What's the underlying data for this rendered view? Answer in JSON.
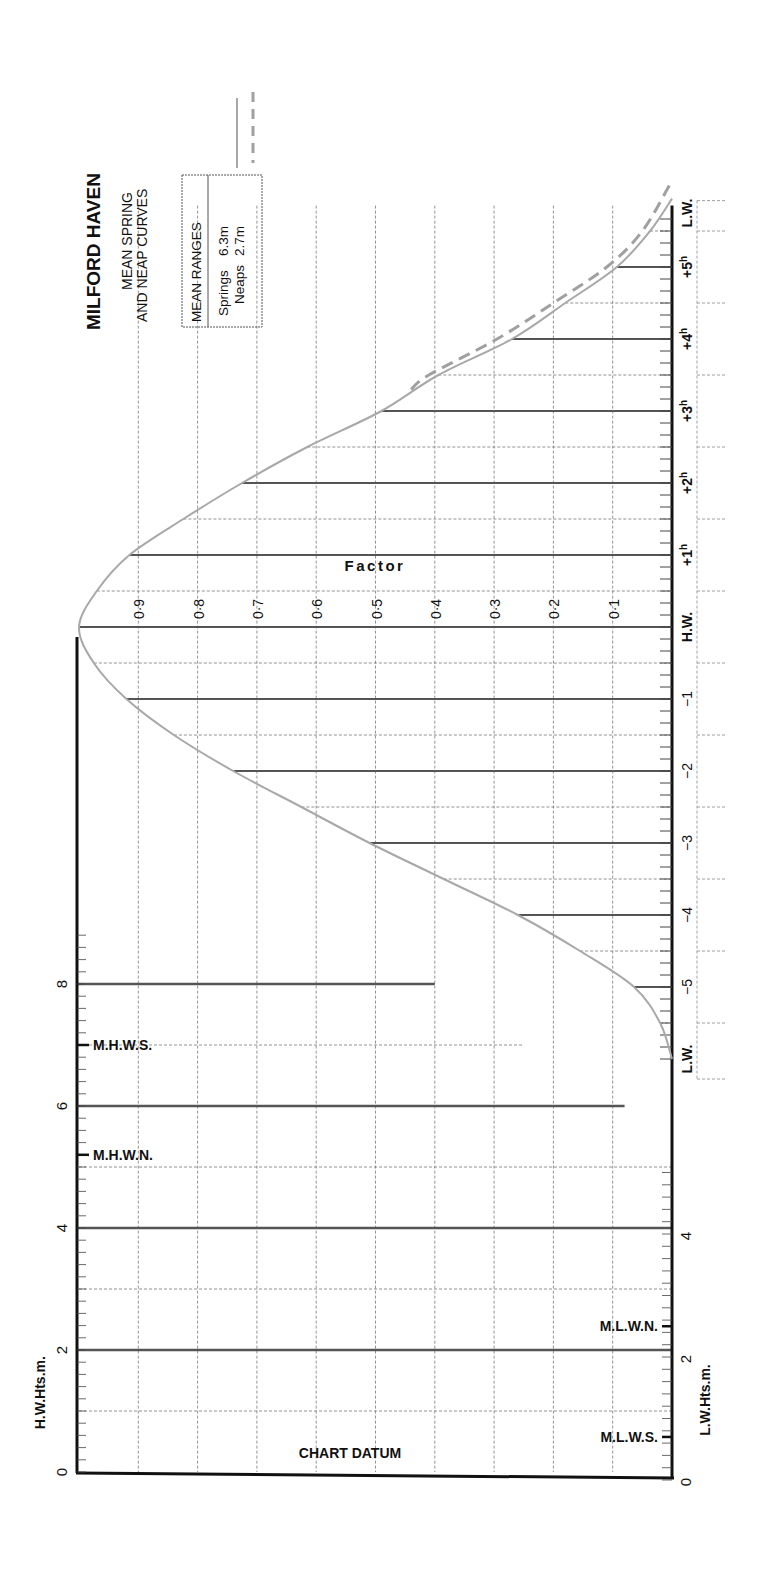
{
  "chart_data": {
    "type": "line",
    "title": "MILFORD HAVEN",
    "subtitle_lines": [
      "MEAN SPRING",
      "AND NEAP CURVES"
    ],
    "orientation": "rotated-90",
    "xlabel": "Time relative to H.W. (hours)",
    "ylabel": "Factor",
    "factor_ticks": [
      "0·1",
      "0·2",
      "0·3",
      "0·4",
      "0·5",
      "0·6",
      "0·7",
      "0·8",
      "0·9"
    ],
    "time_ticks": [
      {
        "t": -6.0,
        "label": "L.W."
      },
      {
        "t": -5,
        "label": "−5"
      },
      {
        "t": -4,
        "label": "−4"
      },
      {
        "t": -3,
        "label": "−3"
      },
      {
        "t": -2,
        "label": "−2"
      },
      {
        "t": -1,
        "label": "−1"
      },
      {
        "t": 0,
        "label": "H.W."
      },
      {
        "t": 1,
        "label": "+1",
        "sup": "h"
      },
      {
        "t": 2,
        "label": "+2",
        "sup": "h"
      },
      {
        "t": 3,
        "label": "+3",
        "sup": "h"
      },
      {
        "t": 4,
        "label": "+4",
        "sup": "h"
      },
      {
        "t": 5,
        "label": "+5",
        "sup": "h"
      }
    ],
    "lw_end_label": "L.W.",
    "ylim": [
      0,
      1
    ],
    "series": [
      {
        "name": "Springs",
        "style": "solid",
        "color": "#a8a8a8",
        "x": [
          -6.0,
          -5.5,
          -5.0,
          -4.5,
          -4.0,
          -3.5,
          -3.0,
          -2.5,
          -2.0,
          -1.5,
          -1.0,
          -0.5,
          0,
          0.5,
          1.0,
          1.5,
          2.0,
          2.5,
          3.0,
          3.5,
          4.0,
          4.5,
          5.0,
          5.5,
          5.95
        ],
        "y": [
          0.0,
          0.02,
          0.064,
          0.155,
          0.26,
          0.385,
          0.51,
          0.625,
          0.74,
          0.84,
          0.92,
          0.975,
          1.0,
          0.97,
          0.915,
          0.824,
          0.725,
          0.615,
          0.49,
          0.394,
          0.27,
          0.18,
          0.093,
          0.037,
          0.0
        ]
      },
      {
        "name": "Neaps",
        "style": "dashed",
        "color": "#a0a0a0",
        "x": [
          3.3,
          3.5,
          4.0,
          4.5,
          5.0,
          5.5,
          6.2
        ],
        "y": [
          0.44,
          0.41,
          0.295,
          0.2,
          0.11,
          0.05,
          0.0
        ]
      }
    ],
    "heights": {
      "hw_axis_label": "H.W.Hts.m.",
      "lw_axis_label": "L.W.Hts.m.",
      "datum_label": "CHART DATUM",
      "hw_tick_labels": [
        {
          "v": 0,
          "label": "0"
        },
        {
          "v": 2,
          "label": "2"
        },
        {
          "v": 4,
          "label": "4"
        },
        {
          "v": 6,
          "label": "6"
        },
        {
          "v": 8,
          "label": "8"
        }
      ],
      "lw_tick_labels": [
        {
          "v": 0,
          "label": "0"
        },
        {
          "v": 2,
          "label": "2"
        },
        {
          "v": 4,
          "label": "4"
        }
      ],
      "hw_markers": [
        {
          "name": "M.H.W.S.",
          "value": 7.0
        },
        {
          "name": "M.H.W.N.",
          "value": 5.2
        }
      ],
      "lw_markers": [
        {
          "name": "M.L.W.N.",
          "value": 2.5
        },
        {
          "name": "M.L.W.S.",
          "value": 0.7
        }
      ],
      "height_lines": [
        {
          "v": 8,
          "end_factor": 0.4
        },
        {
          "v": 6,
          "end_factor": 0.08
        },
        {
          "v": 4,
          "end_factor": 0.0
        },
        {
          "v": 2,
          "end_factor": 0.0
        }
      ],
      "half_lines": [
        {
          "v": 7,
          "end_factor": 0.25
        },
        {
          "v": 5,
          "end_factor": 0.0
        },
        {
          "v": 3,
          "end_factor": 0.0
        },
        {
          "v": 1,
          "end_factor": 0.0
        }
      ]
    },
    "legend": {
      "box_title": "MEAN RANGES",
      "entries": [
        {
          "label": "Springs",
          "value": "6.3m",
          "style": "solid"
        },
        {
          "label": "Neaps",
          "value": "2.7m",
          "style": "dashed"
        }
      ]
    },
    "factor_axis_label": "Factor"
  }
}
